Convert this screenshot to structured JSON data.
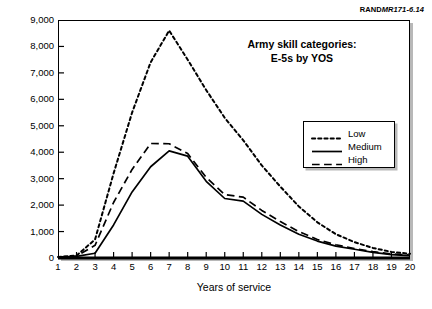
{
  "source_label": {
    "prefix": "RAND",
    "italic": "MR171-6.14"
  },
  "chart_data": {
    "type": "line",
    "title": "Army skill categories:\nE-5s by YOS",
    "title_line1": "Army skill categories:",
    "title_line2": "E-5s by YOS",
    "xlabel": "Years of service",
    "ylabel": "",
    "xlim": [
      1,
      20
    ],
    "ylim": [
      0,
      9000
    ],
    "grid": false,
    "legend_position": "upper-right-inside",
    "x": [
      1,
      2,
      3,
      4,
      5,
      6,
      7,
      8,
      9,
      10,
      11,
      12,
      13,
      14,
      15,
      16,
      17,
      18,
      19,
      20
    ],
    "xtick_labels": [
      "1",
      "2",
      "3",
      "4",
      "5",
      "6",
      "7",
      "8",
      "9",
      "10",
      "11",
      "12",
      "13",
      "14",
      "15",
      "16",
      "17",
      "18",
      "19",
      "20"
    ],
    "ytick_labels": [
      "0",
      "1,000",
      "2,000",
      "3,000",
      "4,000",
      "5,000",
      "6,000",
      "7,000",
      "8,000",
      "9,000"
    ],
    "ytick_values": [
      0,
      1000,
      2000,
      3000,
      4000,
      5000,
      6000,
      7000,
      8000,
      9000
    ],
    "series": [
      {
        "name": "Low",
        "style": "dotted",
        "values": [
          40,
          90,
          700,
          3200,
          5500,
          7400,
          8600,
          7500,
          6350,
          5300,
          4450,
          3500,
          2700,
          1950,
          1350,
          900,
          600,
          380,
          230,
          160
        ]
      },
      {
        "name": "Medium",
        "style": "solid",
        "values": [
          30,
          60,
          180,
          1250,
          2500,
          3450,
          4050,
          3850,
          2900,
          2250,
          2150,
          1650,
          1250,
          900,
          640,
          450,
          330,
          210,
          130,
          90
        ]
      },
      {
        "name": "High",
        "style": "dashed",
        "values": [
          35,
          75,
          480,
          2100,
          3350,
          4330,
          4320,
          3950,
          3050,
          2400,
          2300,
          1800,
          1380,
          1000,
          700,
          500,
          360,
          240,
          150,
          110
        ]
      }
    ]
  }
}
